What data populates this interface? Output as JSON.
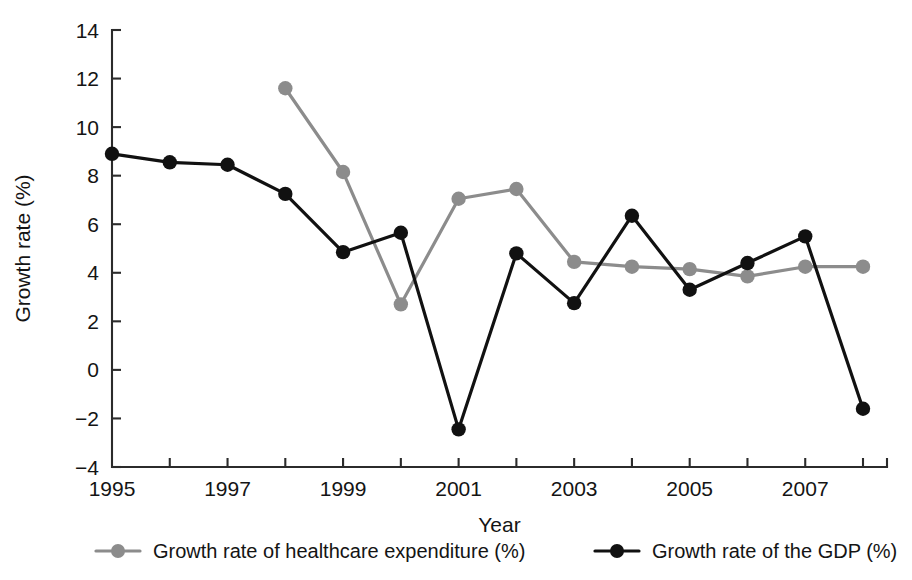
{
  "chart_data": {
    "type": "line",
    "title": "",
    "xlabel": "Year",
    "ylabel": "Growth rate (%)",
    "x": [
      1995,
      1996,
      1997,
      1998,
      1999,
      2000,
      2001,
      2002,
      2003,
      2004,
      2005,
      2006,
      2007,
      2008
    ],
    "xlim": [
      1994.5,
      2008.5
    ],
    "ylim": [
      -4,
      14
    ],
    "yticks": [
      -4,
      -2,
      0,
      2,
      4,
      6,
      8,
      10,
      12,
      14
    ],
    "ytick_labels": [
      "−4",
      "−2",
      "0",
      "2",
      "4",
      "6",
      "8",
      "10",
      "12",
      "14"
    ],
    "xticks": [
      1995,
      1996,
      1997,
      1998,
      1999,
      2000,
      2001,
      2002,
      2003,
      2004,
      2005,
      2006,
      2007,
      2008
    ],
    "xtick_labels_shown": [
      {
        "x": 1995,
        "label": "1995"
      },
      {
        "x": 1997,
        "label": "1997"
      },
      {
        "x": 1999,
        "label": "1999"
      },
      {
        "x": 2001,
        "label": "2001"
      },
      {
        "x": 2003,
        "label": "2003"
      },
      {
        "x": 2005,
        "label": "2005"
      },
      {
        "x": 2007,
        "label": "2007"
      }
    ],
    "grid": false,
    "legend_position": "below",
    "series": [
      {
        "name": "Growth rate of healthcare expenditure (%)",
        "color": "#8c8c8c",
        "marker": "circle",
        "points": [
          {
            "x": 1998,
            "y": 11.6
          },
          {
            "x": 1999,
            "y": 8.15
          },
          {
            "x": 2000,
            "y": 2.7
          },
          {
            "x": 2001,
            "y": 7.05
          },
          {
            "x": 2002,
            "y": 7.45
          },
          {
            "x": 2003,
            "y": 4.45
          },
          {
            "x": 2004,
            "y": 4.25
          },
          {
            "x": 2005,
            "y": 4.15
          },
          {
            "x": 2006,
            "y": 3.85
          },
          {
            "x": 2007,
            "y": 4.25
          },
          {
            "x": 2008,
            "y": 4.25
          }
        ]
      },
      {
        "name": "Growth rate of the GDP (%)",
        "color": "#111111",
        "marker": "circle",
        "points": [
          {
            "x": 1995,
            "y": 8.9
          },
          {
            "x": 1996,
            "y": 8.55
          },
          {
            "x": 1997,
            "y": 8.45
          },
          {
            "x": 1998,
            "y": 7.25
          },
          {
            "x": 1999,
            "y": 4.85
          },
          {
            "x": 2000,
            "y": 5.65
          },
          {
            "x": 2001,
            "y": -2.45
          },
          {
            "x": 2002,
            "y": 4.8
          },
          {
            "x": 2003,
            "y": 2.75
          },
          {
            "x": 2004,
            "y": 6.35
          },
          {
            "x": 2005,
            "y": 3.3
          },
          {
            "x": 2006,
            "y": 4.4
          },
          {
            "x": 2007,
            "y": 5.5
          },
          {
            "x": 2008,
            "y": -1.6
          }
        ]
      }
    ]
  },
  "legend": {
    "items": [
      {
        "label": "Growth rate of healthcare expenditure (%)",
        "color": "#8c8c8c"
      },
      {
        "label": "Growth rate of the GDP (%)",
        "color": "#111111"
      }
    ]
  }
}
